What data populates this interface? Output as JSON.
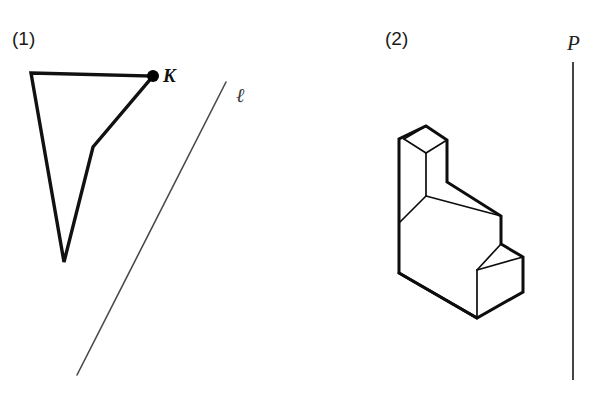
{
  "figure": {
    "width": 600,
    "height": 415,
    "background": "#ffffff",
    "stroke_color": "#111111",
    "thin_stroke_color": "#4a4a4a"
  },
  "panels": [
    {
      "id": "panel-1",
      "label": "(1)",
      "label_x": 12,
      "label_y": 45,
      "description": "concave quadrilateral (dart) with marked vertex K and a separate slanted line labelled l",
      "shape": {
        "name": "dart-quadrilateral",
        "points": "31,73 153,76 93,147 64,262",
        "vertices": [
          {
            "name": "top-left",
            "x": 31,
            "y": 73
          },
          {
            "name": "K",
            "x": 153,
            "y": 76
          },
          {
            "name": "reflex-bend",
            "x": 93,
            "y": 147
          },
          {
            "name": "bottom",
            "x": 64,
            "y": 262
          }
        ]
      },
      "marked_point": {
        "label": "K",
        "x": 153,
        "y": 76,
        "radius": 6,
        "label_x": 163,
        "label_y": 82
      },
      "line": {
        "label": "ℓ",
        "x1": 226,
        "y1": 82,
        "x2": 77,
        "y2": 375,
        "label_x": 236,
        "label_y": 102
      }
    },
    {
      "id": "panel-2",
      "label": "(2)",
      "label_x": 385,
      "label_y": 45,
      "description": "isometric stepped L-shaped solid block beside a vertical line labelled P",
      "solid": {
        "name": "stepped-block",
        "outline": "426,126 447,140 447,182 501,216 501,244 523,257 523,292 477,318 399,273 399,139",
        "inner_edges": [
          {
            "name": "top-face-left-edge",
            "path": "426,126 404,139 426,153"
          },
          {
            "name": "top-face-right-edge",
            "path": "447,140 426,153"
          },
          {
            "name": "front-left-vertical",
            "path": "426,153 426,196"
          },
          {
            "name": "upper-step-top",
            "path": "426,196 501,216"
          },
          {
            "name": "front-left-lower",
            "path": "399,223 426,196"
          },
          {
            "name": "mid-step-vertical",
            "path": "501,216 501,244"
          },
          {
            "name": "mid-step-top",
            "path": "501,244 523,257"
          },
          {
            "name": "lower-step-vertical",
            "path": "477,270 477,318"
          },
          {
            "name": "lower-step-top",
            "path": "501,244 477,270"
          },
          {
            "name": "lower-step-back",
            "path": "477,270 523,257"
          },
          {
            "name": "bottom-front-edge",
            "path": "399,273 477,318"
          }
        ]
      },
      "line": {
        "label": "P",
        "x1": 573,
        "y1": 62,
        "x2": 573,
        "y2": 380,
        "label_x": 567,
        "label_y": 50
      }
    }
  ]
}
